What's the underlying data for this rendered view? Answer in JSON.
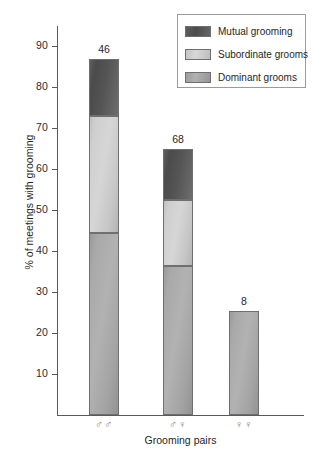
{
  "chart_data": {
    "type": "bar",
    "subtype": "stacked-bar",
    "title": "",
    "xlabel": "Grooming pairs",
    "ylabel": "% of meetings with grooming",
    "categories": [
      "♂♂",
      "♂♀",
      "♀♀"
    ],
    "category_names": [
      "male-male",
      "male-female",
      "female-female"
    ],
    "series": [
      {
        "name": "Mutual grooming",
        "values": [
          14.0,
          12.5,
          0.0
        ],
        "color": "#555555"
      },
      {
        "name": "Subordinate grooms",
        "values": [
          28.5,
          16.0,
          0.0
        ],
        "color": "#d0d0d0"
      },
      {
        "name": "Dominant grooms",
        "values": [
          44.5,
          36.5,
          25.5
        ],
        "color": "#a8a8a8"
      }
    ],
    "stack_order_bottom_to_top": [
      "Dominant grooms",
      "Subordinate grooms",
      "Mutual grooming"
    ],
    "totals": [
      87.0,
      65.0,
      25.5
    ],
    "bar_labels": [
      "46",
      "68",
      "8"
    ],
    "ylim": [
      0,
      95
    ],
    "yticks": [
      10,
      20,
      30,
      40,
      50,
      60,
      70,
      80,
      90
    ],
    "ytick_labels": [
      "10",
      "20",
      "30",
      "40",
      "50",
      "60",
      "70",
      "80",
      "90"
    ],
    "grid": false,
    "legend_position": "top-right"
  },
  "legend": {
    "items": [
      {
        "label": "Mutual grooming",
        "swatch": "mutual"
      },
      {
        "label": "Subordinate grooms",
        "swatch": "subordinate"
      },
      {
        "label": "Dominant grooms",
        "swatch": "dominant"
      }
    ]
  }
}
